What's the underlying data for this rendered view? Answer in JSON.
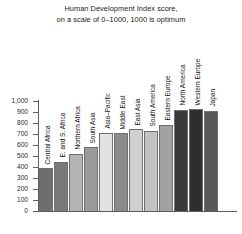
{
  "chart_data": {
    "type": "bar",
    "title": "Human Development Index score, on a scale of 0–1000, 1000 is optimum",
    "title_lines": [
      "Human Development Index score,",
      "on a scale of 0–1000, 1000 is optimum"
    ],
    "xlabel": "",
    "ylabel": "",
    "ylim": [
      0,
      1000
    ],
    "grid": false,
    "legend": false,
    "ytick_labels": [
      "1,000",
      "900",
      "800",
      "700",
      "600",
      "500",
      "400",
      "300",
      "200",
      "100",
      "0"
    ],
    "ytick_values": [
      1000,
      900,
      800,
      700,
      600,
      500,
      400,
      300,
      200,
      100,
      0
    ],
    "categories": [
      "Central Africa",
      "E. and S. Africa",
      "Northern Africa",
      "South Asia",
      "Asia–Pacific",
      "Middle East",
      "East Asia",
      "South America",
      "Eastern Europe",
      "North America",
      "Western Europe",
      "Japan"
    ],
    "values": [
      390,
      450,
      520,
      580,
      710,
      705,
      745,
      730,
      785,
      920,
      925,
      910
    ],
    "bar_colors": [
      "#6e6e6e",
      "#7a7a7a",
      "#b4b4b4",
      "#9a9a9a",
      "#e2e2e2",
      "#8a8a8a",
      "#cfcfcf",
      "#c2c2c2",
      "#a2a2a2",
      "#3a3a3a",
      "#2e2e2e",
      "#585858"
    ]
  }
}
